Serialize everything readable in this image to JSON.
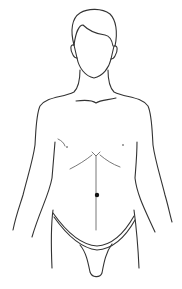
{
  "figure": {
    "marker": {
      "label": "navel point",
      "color": "#111111"
    },
    "stroke_color": "#333333",
    "background": "#ffffff"
  },
  "caption": {
    "text": ""
  }
}
